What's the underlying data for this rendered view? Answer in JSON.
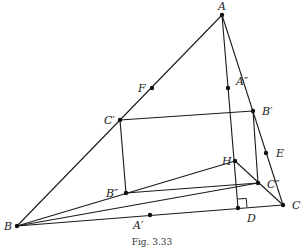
{
  "caption": "Fig. 3.33",
  "points": {
    "A": {
      "label": "A",
      "x": 222,
      "y": 15,
      "lx": 218,
      "ly": 10
    },
    "B": {
      "label": "B",
      "x": 17,
      "y": 226,
      "lx": 4,
      "ly": 230
    },
    "C": {
      "label": "C",
      "x": 283,
      "y": 205,
      "lx": 292,
      "ly": 209
    },
    "D": {
      "label": "D",
      "x": 238,
      "y": 208,
      "lx": 247,
      "ly": 222
    },
    "E": {
      "label": "E",
      "x": 266,
      "y": 153,
      "lx": 276,
      "ly": 157
    },
    "F": {
      "label": "F",
      "x": 152,
      "y": 88,
      "lx": 138,
      "ly": 92
    },
    "H": {
      "label": "H",
      "x": 235,
      "y": 161,
      "lx": 222,
      "ly": 165
    },
    "Ap": {
      "label": "A′",
      "x": 150,
      "y": 215,
      "lx": 133,
      "ly": 229
    },
    "Bp": {
      "label": "B′",
      "x": 253,
      "y": 111,
      "lx": 262,
      "ly": 115
    },
    "Cp": {
      "label": "C′",
      "x": 120,
      "y": 120,
      "lx": 104,
      "ly": 124
    },
    "App": {
      "label": "A″",
      "x": 228,
      "y": 88,
      "lx": 236,
      "ly": 85
    },
    "Bpp": {
      "label": "B″",
      "x": 126,
      "y": 193,
      "lx": 106,
      "ly": 197
    },
    "Cpp": {
      "label": "C″",
      "x": 258,
      "y": 183,
      "lx": 267,
      "ly": 188
    }
  },
  "segments": [
    [
      "A",
      "B"
    ],
    [
      "A",
      "C"
    ],
    [
      "B",
      "C"
    ],
    [
      "A",
      "D"
    ],
    [
      "Cp",
      "Bp"
    ],
    [
      "Cp",
      "Bpp"
    ],
    [
      "Bp",
      "Cpp"
    ],
    [
      "Bpp",
      "Cpp"
    ],
    [
      "B",
      "H"
    ],
    [
      "H",
      "C"
    ],
    [
      "B",
      "Cpp"
    ]
  ],
  "right_angle": {
    "at": "D",
    "size": 9
  }
}
